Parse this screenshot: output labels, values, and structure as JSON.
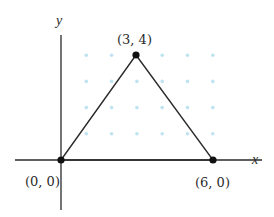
{
  "diagram": {
    "type": "coordinate-plane-triangle",
    "axes": {
      "x_label": "x",
      "y_label": "y"
    },
    "grid": {
      "style": "dots",
      "x_range": [
        1,
        6
      ],
      "y_range": [
        1,
        4
      ],
      "color": "#bfe3f0"
    },
    "vertices": [
      {
        "x": 0,
        "y": 0,
        "label": "(0, 0)"
      },
      {
        "x": 6,
        "y": 0,
        "label": "(6, 0)"
      },
      {
        "x": 3,
        "y": 4,
        "label": "(3, 4)"
      }
    ],
    "colors": {
      "line": "#2a2a2a",
      "vertex": "#111111",
      "dot": "#bfe3f0"
    }
  }
}
